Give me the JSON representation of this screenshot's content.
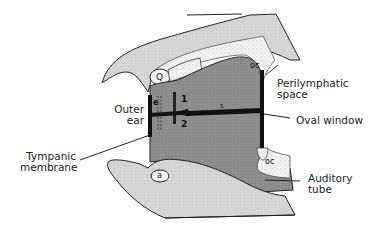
{
  "diagram": {
    "colors": {
      "bone": "#d6d6d6",
      "otic_capsule": "#ececec",
      "cavity": "#8c8c8c",
      "ossicle": "#111111",
      "outline": "#222222"
    },
    "labels": {
      "outer_ear": [
        "Outer",
        "ear"
      ],
      "tympanic_membrane": [
        "Tympanic",
        "membrane"
      ],
      "perilymphatic_space": [
        "Perilymphatic",
        "space"
      ],
      "oval_window": "Oval window",
      "auditory_tube": [
        "Auditory",
        "tube"
      ]
    },
    "markers": {
      "oc_top": "oc",
      "oc_bottom": "oc",
      "q": "Q",
      "a": "a",
      "e": "e",
      "one": "1",
      "two": "2",
      "s": "s"
    }
  }
}
